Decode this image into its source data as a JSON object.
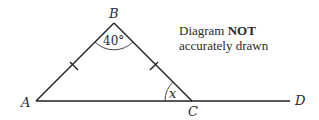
{
  "diagram": {
    "points": {
      "A": {
        "label": "A",
        "x": 36,
        "y": 101
      },
      "B": {
        "label": "B",
        "x": 114,
        "y": 23
      },
      "C": {
        "label": "C",
        "x": 192,
        "y": 101
      },
      "D": {
        "label": "D",
        "x": 290,
        "y": 101
      }
    },
    "angle_B": "40°",
    "angle_C": "x",
    "note": {
      "line1_prefix": "Diagram ",
      "line1_bold": "NOT",
      "line2": "accurately drawn"
    },
    "colors": {
      "stroke": "#222222",
      "text": "#2a2a2a"
    }
  }
}
